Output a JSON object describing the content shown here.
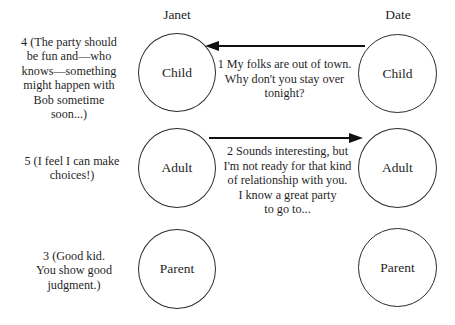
{
  "diagram": {
    "type": "transactional-analysis-crossed-transaction",
    "columns": [
      {
        "key": "janet",
        "header": "Janet"
      },
      {
        "key": "date",
        "header": "Date"
      }
    ],
    "ego_states": {
      "child": "Child",
      "adult": "Adult",
      "parent": "Parent"
    },
    "transactions": [
      {
        "number": "1",
        "direction": "right-to-left",
        "from": "date.child",
        "to": "janet.child",
        "text": "1 My folks are out of town. Why don't you stay over tonight?",
        "lines": [
          "1 My folks are out of town.",
          "Why don't you stay over",
          "tonight?"
        ]
      },
      {
        "number": "2",
        "direction": "left-to-right",
        "from": "janet.adult",
        "to": "date.adult",
        "text": "2 Sounds interesting, but I'm not ready for that kind of relationship with you. I know a great party to go to...",
        "lines": [
          "2 Sounds interesting, but",
          "I'm not ready for that kind",
          "of relationship with you.",
          "I know a great party",
          "to go to..."
        ]
      }
    ],
    "side_notes": [
      {
        "number": "4",
        "aligned_to": "janet.child",
        "text": "4 (The party should be fun and—who knows—something might happen with Bob sometime soon...)",
        "lines": [
          "4 (The party should",
          "be fun and—who",
          "knows—something",
          "might happen with",
          "Bob sometime",
          "soon...)"
        ]
      },
      {
        "number": "5",
        "aligned_to": "janet.adult",
        "text": "5 (I feel I can make choices!)",
        "lines": [
          "5 (I feel I can make",
          "choices!)"
        ]
      },
      {
        "number": "3",
        "aligned_to": "janet.parent",
        "text": "3 (Good kid. You show good judgment.)",
        "lines": [
          "3 (Good kid.",
          "You show good",
          "judgment.)"
        ]
      }
    ],
    "colors": {
      "background": "#ffffff",
      "text": "#1f1f1f",
      "stroke": "#2b2b2b"
    }
  }
}
